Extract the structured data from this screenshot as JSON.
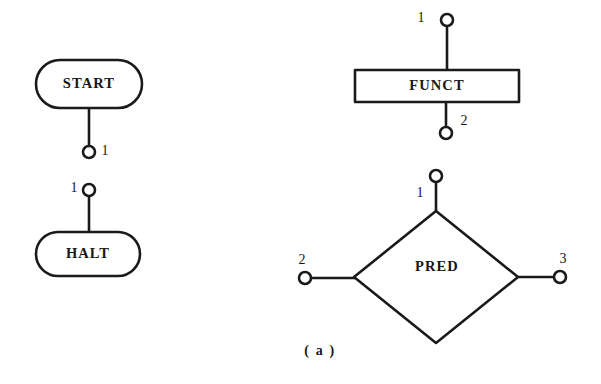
{
  "figure": {
    "caption": "( a )",
    "caption_x": 320,
    "caption_y": 352,
    "background_color": "#ffffff",
    "ink_color": "#1a1a1a"
  },
  "nodes": [
    {
      "id": "start",
      "label": "START",
      "shape": "stadium",
      "x": 36,
      "y": 60,
      "width": 106,
      "height": 48,
      "label_x": 89,
      "label_y": 85
    },
    {
      "id": "halt",
      "label": "HALT",
      "shape": "stadium",
      "x": 36,
      "y": 232,
      "width": 104,
      "height": 44,
      "label_x": 88,
      "label_y": 255
    },
    {
      "id": "funct",
      "label": "FUNCT",
      "shape": "rectangle",
      "x": 355,
      "y": 70,
      "width": 164,
      "height": 32,
      "label_x": 437,
      "label_y": 87
    },
    {
      "id": "pred",
      "label": "PRED",
      "shape": "diamond",
      "center_x": 436,
      "center_y": 277,
      "half_width": 82,
      "half_height": 66,
      "label_x": 437,
      "label_y": 268
    }
  ],
  "ports": [
    {
      "id": "start-port-1",
      "node": "start",
      "label": "1",
      "side": "bottom",
      "circle_x": 89,
      "circle_y": 152,
      "radius": 6,
      "stem_x1": 89,
      "stem_y1": 107,
      "stem_x2": 89,
      "stem_y2": 146,
      "label_x": 105,
      "label_y": 152
    },
    {
      "id": "halt-port-1",
      "node": "halt",
      "label": "1",
      "side": "top",
      "circle_x": 89,
      "circle_y": 190,
      "radius": 6,
      "stem_x1": 89,
      "stem_y1": 196,
      "stem_x2": 89,
      "stem_y2": 234,
      "label_x": 74,
      "label_y": 189
    },
    {
      "id": "funct-port-1",
      "node": "funct",
      "label": "1",
      "side": "top",
      "circle_x": 447,
      "circle_y": 20,
      "radius": 6,
      "stem_x1": 447,
      "stem_y1": 26,
      "stem_x2": 447,
      "stem_y2": 71,
      "label_x": 421,
      "label_y": 19
    },
    {
      "id": "funct-port-2",
      "node": "funct",
      "label": "2",
      "side": "bottom",
      "circle_x": 446,
      "circle_y": 133,
      "radius": 6,
      "stem_x1": 446,
      "stem_y1": 101,
      "stem_x2": 446,
      "stem_y2": 127,
      "label_x": 464,
      "label_y": 122
    },
    {
      "id": "pred-port-1",
      "node": "pred",
      "label": "1",
      "side": "top",
      "circle_x": 436,
      "circle_y": 176,
      "radius": 6,
      "stem_x1": 436,
      "stem_y1": 182,
      "stem_x2": 436,
      "stem_y2": 212,
      "label_x": 420,
      "label_y": 194
    },
    {
      "id": "pred-port-2",
      "node": "pred",
      "label": "2",
      "side": "left",
      "circle_x": 305,
      "circle_y": 278,
      "radius": 6,
      "stem_x1": 311,
      "stem_y1": 278,
      "stem_x2": 355,
      "stem_y2": 278,
      "label_x": 302,
      "label_y": 261
    },
    {
      "id": "pred-port-3",
      "node": "pred",
      "label": "3",
      "side": "right",
      "circle_x": 560,
      "circle_y": 277,
      "radius": 6,
      "stem_x1": 518,
      "stem_y1": 277,
      "stem_x2": 554,
      "stem_y2": 277,
      "label_x": 563,
      "label_y": 260
    }
  ]
}
